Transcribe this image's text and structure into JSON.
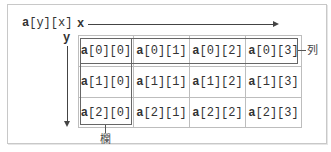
{
  "diagram": {
    "array_label_name": "a",
    "array_label_index": "[y][x]",
    "x_axis_label": "x",
    "y_axis_label": "y",
    "row_label": "列",
    "column_label": "欄",
    "rows": 3,
    "columns": 4,
    "cells": [
      [
        {
          "name": "a",
          "index": "[0][0]"
        },
        {
          "name": "a",
          "index": "[0][1]"
        },
        {
          "name": "a",
          "index": "[0][2]"
        },
        {
          "name": "a",
          "index": "[0][3]"
        }
      ],
      [
        {
          "name": "a",
          "index": "[1][0]"
        },
        {
          "name": "a",
          "index": "[1][1]"
        },
        {
          "name": "a",
          "index": "[1][2]"
        },
        {
          "name": "a",
          "index": "[1][3]"
        }
      ],
      [
        {
          "name": "a",
          "index": "[2][0]"
        },
        {
          "name": "a",
          "index": "[2][1]"
        },
        {
          "name": "a",
          "index": "[2][2]"
        },
        {
          "name": "a",
          "index": "[2][3]"
        }
      ]
    ],
    "highlighted_row": 0,
    "highlighted_column": 0
  }
}
